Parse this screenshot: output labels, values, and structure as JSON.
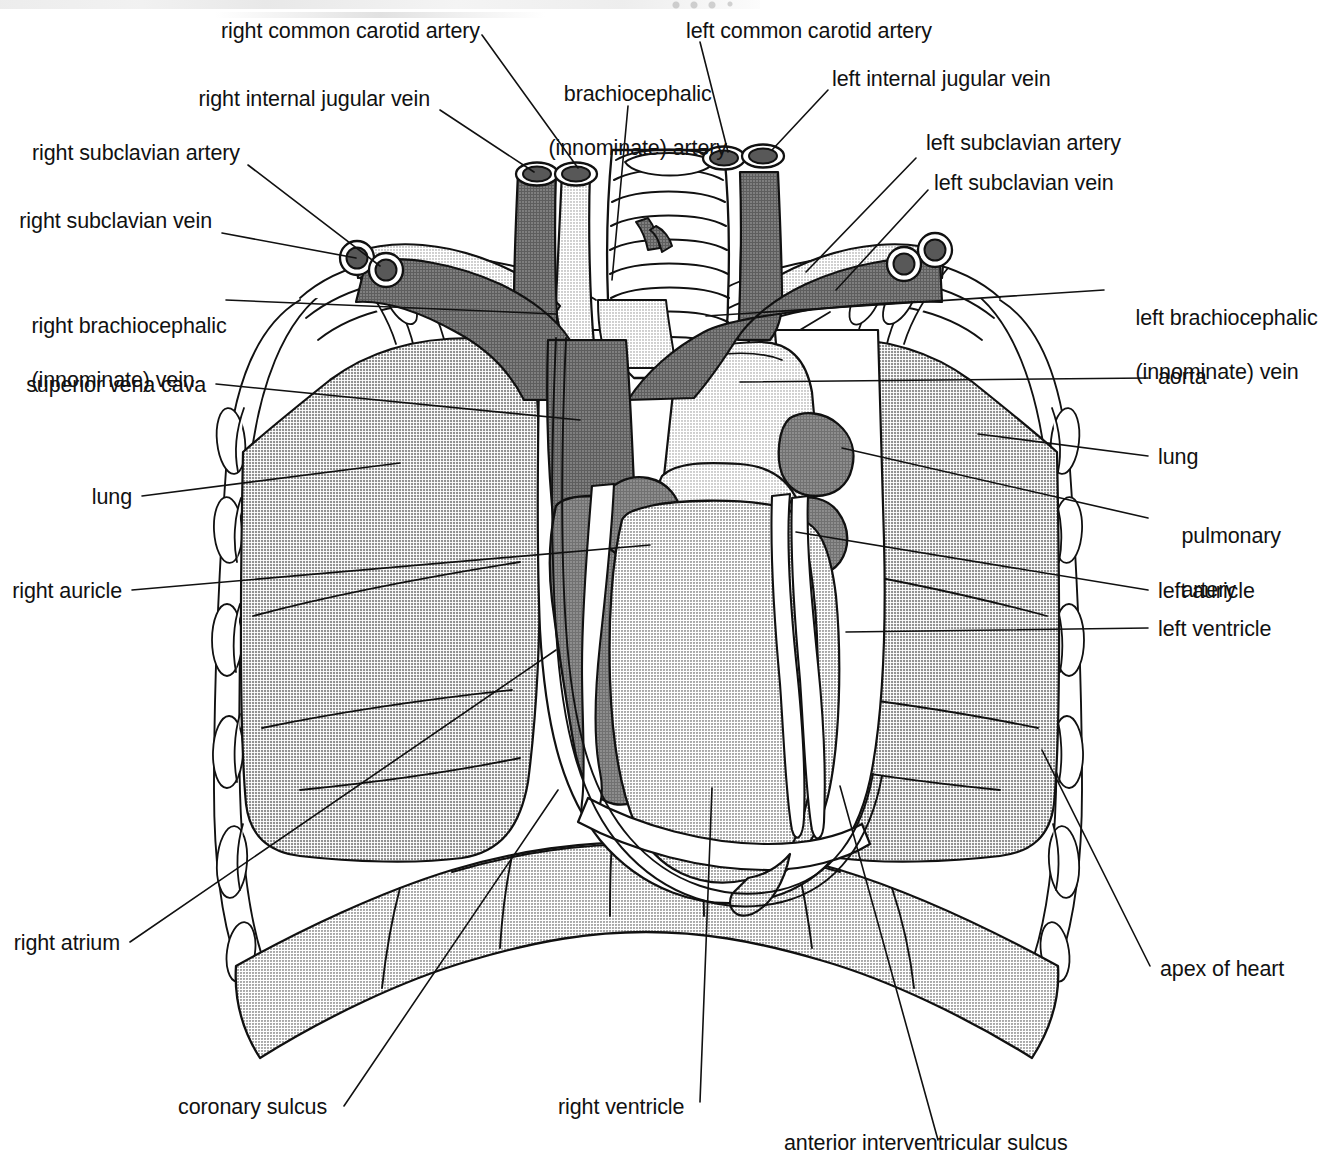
{
  "figure": {
    "type": "anatomical-illustration"
  },
  "palette": {
    "vein_dark": "#6b6b6b",
    "artery_light": "#dcdcdc",
    "lung_gray": "#b3b3b3",
    "heart_light": "#c9c9c9",
    "heart_dark": "#7d7d7d",
    "diaphragm": "#b0b0b0",
    "outline": "#111111",
    "paper": "#ffffff"
  },
  "labels": {
    "right_common_carotid_artery": "right common carotid artery",
    "right_internal_jugular_vein": "right internal jugular vein",
    "right_subclavian_artery": "right subclavian artery",
    "right_subclavian_vein": "right subclavian vein",
    "right_brachiocephalic_vein_l1": "right brachiocephalic",
    "right_brachiocephalic_vein_l2": "(innominate) vein",
    "superior_vena_cava": "superior vena cava",
    "lung_left_side": "lung",
    "right_auricle": "right auricle",
    "right_atrium": "right atrium",
    "coronary_sulcus": "coronary sulcus",
    "right_ventricle": "right ventricle",
    "brachiocephalic_artery_l1": "brachiocephalic",
    "brachiocephalic_artery_l2": "(innominate) artery",
    "left_common_carotid_artery": "left common carotid artery",
    "left_internal_jugular_vein": "left internal jugular vein",
    "left_subclavian_artery": "left subclavian artery",
    "left_subclavian_vein": "left subclavian vein",
    "left_brachiocephalic_vein_l1": "left brachiocephalic",
    "left_brachiocephalic_vein_l2": "(innominate) vein",
    "aorta": "aorta",
    "lung_right_side": "lung",
    "pulmonary_artery_l1": "pulmonary",
    "pulmonary_artery_l2": "artery",
    "left_auricle": "left auricle",
    "left_ventricle": "left ventricle",
    "apex_of_heart": "apex of heart",
    "anterior_interventricular_sulcus": "anterior interventricular sulcus"
  }
}
